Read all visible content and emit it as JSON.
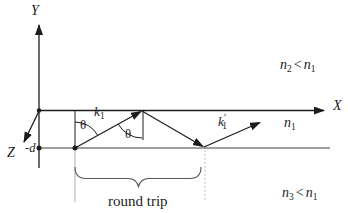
{
  "figure": {
    "colors": {
      "background": "#ffffff",
      "ink": "#1c1c1c",
      "interface": "#3f3f3f",
      "guide": "#9a9a9a",
      "brace": "#555555"
    },
    "axes": {
      "y_label": "Y",
      "x_label": "X",
      "z_label": "Z",
      "depth_label": "-d"
    },
    "rays": {
      "k1": {
        "base": "k",
        "sub": "1"
      },
      "k1_prime": {
        "base": "k",
        "prime": "′",
        "sub": "1"
      }
    },
    "angles": {
      "theta_incident": "θ",
      "theta_reflected": "θ"
    },
    "media": {
      "core": {
        "base": "n",
        "sub": "1"
      },
      "cover_relation": {
        "lhs_base": "n",
        "lhs_sub": "2",
        "operator": "<",
        "rhs_base": "n",
        "rhs_sub": "1"
      },
      "substrate_relation": {
        "lhs_base": "n",
        "lhs_sub": "3",
        "operator": "<",
        "rhs_base": "n",
        "rhs_sub": "1"
      }
    },
    "annotation": {
      "round_trip": "round trip"
    }
  }
}
